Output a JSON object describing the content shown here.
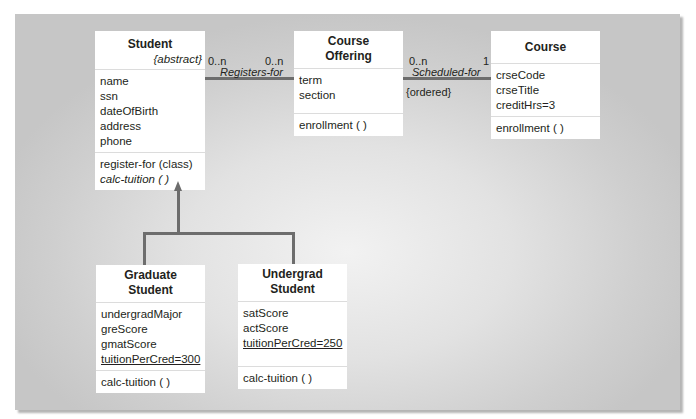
{
  "classes": {
    "student": {
      "name": "Student",
      "stereotype": "{abstract}",
      "attributes": [
        "name",
        "ssn",
        "dateOfBirth",
        "address",
        "phone"
      ],
      "operations": [
        "register-for (class)",
        "calc-tuition ( )"
      ]
    },
    "course_offering": {
      "name_line1": "Course",
      "name_line2": "Offering",
      "attributes": [
        "term",
        "section"
      ],
      "operations": [
        "enrollment ( )"
      ]
    },
    "course": {
      "name": "Course",
      "attributes": [
        "crseCode",
        "crseTitle",
        "creditHrs=3"
      ],
      "operations": [
        "enrollment ( )"
      ]
    },
    "graduate_student": {
      "name_line1": "Graduate",
      "name_line2": "Student",
      "attributes": [
        "undergradMajor",
        "greScore",
        "gmatScore",
        "tuitionPerCred=300"
      ],
      "operations": [
        "calc-tuition ( )"
      ]
    },
    "undergrad_student": {
      "name_line1": "Undergrad",
      "name_line2": "Student",
      "attributes": [
        "satScore",
        "actScore",
        "tuitionPerCred=250"
      ],
      "operations": [
        "calc-tuition ( )"
      ]
    }
  },
  "associations": {
    "registers_for": {
      "name": "Registers-for",
      "mult_left": "0..n",
      "mult_right": "0..n"
    },
    "scheduled_for": {
      "name": "Scheduled-for",
      "mult_left": "0..n",
      "mult_right": "1",
      "constraint": "{ordered}"
    }
  },
  "generalization": {
    "parent": "Student",
    "children": [
      "Graduate Student",
      "Undergrad Student"
    ]
  },
  "colors": {
    "line": "#6d6d6d",
    "box": "#ffffff",
    "divider": "#dcdcdc"
  }
}
